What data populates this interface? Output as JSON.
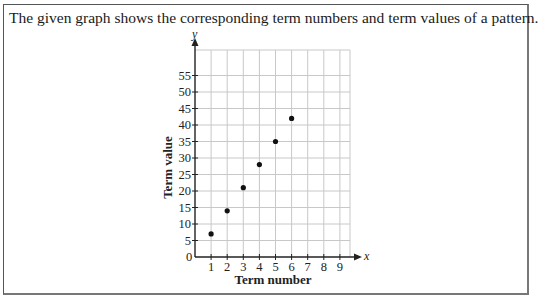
{
  "question": {
    "prompt": "The given graph shows the corresponding term numbers and term values of a pattern."
  },
  "chart_data": {
    "type": "scatter",
    "title": "",
    "xlabel": "Term number",
    "ylabel": "Term value",
    "x_axis_symbol": "x",
    "y_axis_symbol": "y",
    "origin_label": "0",
    "x": [
      1,
      2,
      3,
      4,
      5,
      6
    ],
    "y": [
      7,
      14,
      21,
      28,
      35,
      42
    ],
    "x_ticks": [
      "1",
      "2",
      "3",
      "4",
      "5",
      "6",
      "7",
      "8",
      "9"
    ],
    "y_ticks": [
      "5",
      "10",
      "15",
      "20",
      "25",
      "30",
      "35",
      "40",
      "45",
      "50",
      "55"
    ],
    "xlim": [
      0,
      9.8
    ],
    "ylim": [
      0,
      62
    ],
    "grid": true,
    "legend": null
  }
}
